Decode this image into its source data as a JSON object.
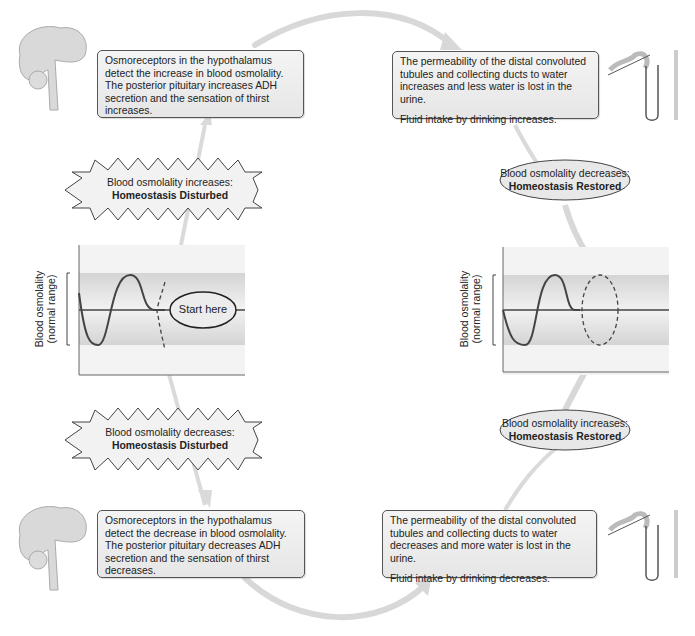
{
  "top_left_box": {
    "text": "Osmoreceptors in the hypothalamus detect the increase in blood osmolality. The posterior pituitary increases ADH secretion and the sensation of thirst increases."
  },
  "top_right_box": {
    "text1": "The permeability of the distal convoluted tubules and collecting ducts to water increases and less water is lost in the urine.",
    "text2": "Fluid intake by drinking increases."
  },
  "bottom_left_box": {
    "text": "Osmoreceptors in the hypothalamus detect the decrease in blood osmolality. The posterior pituitary decreases ADH secretion and the sensation of thirst decreases."
  },
  "bottom_right_box": {
    "text1": "The permeability of the distal convoluted tubules and collecting ducts to water decreases and more water is lost in the urine.",
    "text2": "Fluid intake by drinking decreases."
  },
  "burst_top": {
    "line1": "Blood osmolality increases:",
    "line2": "Homeostasis Disturbed"
  },
  "burst_bottom": {
    "line1": "Blood osmolality decreases:",
    "line2": "Homeostasis Disturbed"
  },
  "oval_top": {
    "line1": "Blood osmolality decreases:",
    "line2": "Homeostasis Restored"
  },
  "oval_bottom": {
    "line1": "Blood osmolality increases:",
    "line2": "Homeostasis Restored"
  },
  "graph_left": {
    "ylabel1": "Blood osmolality",
    "ylabel2": "(normal range)",
    "start_label": "Start here"
  },
  "graph_right": {
    "ylabel1": "Blood osmolality",
    "ylabel2": "(normal range)"
  },
  "colors": {
    "box_border": "#555555",
    "box_fill": "#ececec",
    "arrow": "#d6d6d6",
    "band": "#d0d0d0",
    "line": "#444444"
  }
}
